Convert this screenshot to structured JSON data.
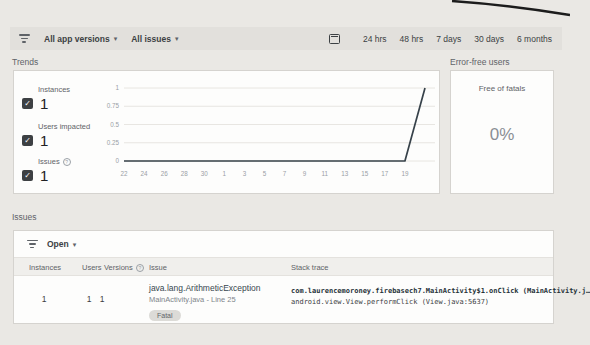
{
  "icons": {
    "check": "✓",
    "caret_down": "▾",
    "help": "?"
  },
  "toolbar": {
    "filters": [
      {
        "label": "All app versions"
      },
      {
        "label": "All issues"
      }
    ],
    "date_ranges": [
      "24 hrs",
      "48 hrs",
      "7 days",
      "30 days",
      "6 months"
    ]
  },
  "trends": {
    "title": "Trends",
    "metrics": [
      {
        "label": "Instances",
        "value": "1",
        "checked": true
      },
      {
        "label": "Users impacted",
        "value": "1",
        "checked": true
      },
      {
        "label": "Issues",
        "value": "1",
        "checked": true,
        "has_help": true
      }
    ]
  },
  "error_free_users": {
    "title": "Error-free users",
    "label": "Free of fatals",
    "value": "0%"
  },
  "issues": {
    "title": "Issues",
    "status_filter": "Open",
    "columns": [
      "Instances",
      "Users",
      "Versions",
      "Issue",
      "Stack trace"
    ],
    "rows": [
      {
        "instances": "1",
        "users": "1",
        "versions": "1",
        "issue_title": "java.lang.ArithmeticException",
        "issue_location": "MainActivity.java - Line 25",
        "severity": "Fatal",
        "stack_line_1": "com.laurencemoroney.firebasech7.MainActivity$1.onClick (MainActivity.j…",
        "stack_line_2": "android.view.View.performClick (View.java:5637)"
      }
    ]
  },
  "chart_data": {
    "type": "line",
    "title": "Trends",
    "x_ticks": [
      "22",
      "24",
      "26",
      "28",
      "30",
      "1",
      "3",
      "5",
      "7",
      "9",
      "11",
      "13",
      "15",
      "17",
      "19"
    ],
    "y_ticks": [
      1,
      0.75,
      0.5,
      0.25,
      0
    ],
    "ylim": [
      0,
      1
    ],
    "grid": true,
    "legend": false,
    "series": [
      {
        "name": "Trend",
        "values": [
          0,
          0,
          0,
          0,
          0,
          0,
          0,
          0,
          0,
          0,
          0,
          0,
          0,
          0,
          0,
          1
        ]
      }
    ],
    "line_color": "#37424a",
    "axis_text_color": "#9aa0a6"
  }
}
